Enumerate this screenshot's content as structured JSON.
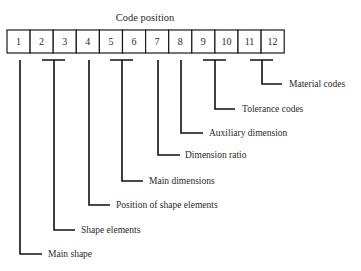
{
  "title": "Code position",
  "positions": [
    "1",
    "2",
    "3",
    "4",
    "5",
    "6",
    "7",
    "8",
    "9",
    "10",
    "11",
    "12"
  ],
  "labels": [
    {
      "id": "main-shape",
      "text": "Main shape",
      "positions": [
        1
      ]
    },
    {
      "id": "shape-elements",
      "text": "Shape elements",
      "positions": [
        2,
        3
      ]
    },
    {
      "id": "position-of-shape-elements",
      "text": "Position of shape elements",
      "positions": [
        4
      ]
    },
    {
      "id": "main-dimensions",
      "text": "Main dimensions",
      "positions": [
        5,
        6
      ]
    },
    {
      "id": "dimension-ratio",
      "text": "Dimension ratio",
      "positions": [
        7
      ]
    },
    {
      "id": "auxiliary-dimension",
      "text": "Auxiliary dimension",
      "positions": [
        8
      ]
    },
    {
      "id": "tolerance-codes",
      "text": "Tolerance codes",
      "positions": [
        9,
        10
      ]
    },
    {
      "id": "material-codes",
      "text": "Material codes",
      "positions": [
        11,
        12
      ]
    }
  ]
}
